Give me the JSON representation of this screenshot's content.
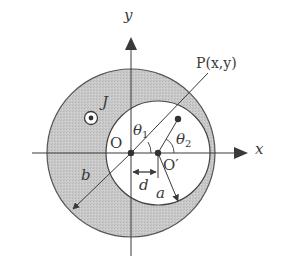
{
  "diagram": {
    "type": "geometry",
    "colors": {
      "shaded_region": "#c8c8c8",
      "cavity": "#ffffff",
      "lines": "#3a3a3a",
      "background": "#ffffff"
    },
    "axes": {
      "x_label": "x",
      "y_label": "y"
    },
    "points": {
      "origin_label": "O",
      "cavity_center_label": "O′",
      "point_label": "P(x,y)"
    },
    "angles": {
      "theta1": {
        "symbol": "θ",
        "subscript": "1"
      },
      "theta2": {
        "symbol": "θ",
        "subscript": "2"
      }
    },
    "dimensions": {
      "outer_radius_label": "b",
      "inner_radius_label": "a",
      "offset_label": "d"
    },
    "current_density": {
      "label": "J",
      "direction_symbol": "out-of-page (⊙)"
    }
  }
}
